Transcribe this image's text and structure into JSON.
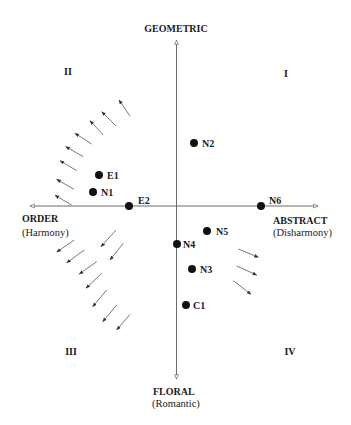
{
  "axes": {
    "vertical": {
      "x": 176.5,
      "y1": 40,
      "y2": 379
    },
    "horizontal": {
      "y": 206,
      "x1": 30,
      "x2": 318
    },
    "top": {
      "label": "GEOMETRIC"
    },
    "bottom": {
      "label": "FLORAL",
      "sublabel": "(Romantic)"
    },
    "left": {
      "label": "ORDER",
      "sublabel": "(Harmony)"
    },
    "right": {
      "label": "ABSTRACT",
      "sublabel": "(Disharmony)"
    }
  },
  "quadrants": {
    "q1": "I",
    "q2": "II",
    "q3": "III",
    "q4": "IV"
  },
  "points": [
    {
      "label": "E1",
      "x": 99,
      "y": 175,
      "lx": 107,
      "ly": 179
    },
    {
      "label": "N1",
      "x": 93,
      "y": 192,
      "lx": 101,
      "ly": 196
    },
    {
      "label": "E2",
      "x": 129,
      "y": 206,
      "lx": 138,
      "ly": 204
    },
    {
      "label": "N2",
      "x": 194,
      "y": 143,
      "lx": 202,
      "ly": 147
    },
    {
      "label": "N6",
      "x": 261,
      "y": 206,
      "lx": 269,
      "ly": 204
    },
    {
      "label": "N5",
      "x": 207,
      "y": 231,
      "lx": 216,
      "ly": 235
    },
    {
      "label": "N4",
      "x": 177,
      "y": 244,
      "lx": 183,
      "ly": 248
    },
    {
      "label": "N3",
      "x": 192,
      "y": 269,
      "lx": 200,
      "ly": 273
    },
    {
      "label": "C1",
      "x": 186,
      "y": 305,
      "lx": 193,
      "ly": 309
    }
  ],
  "arrows": [
    {
      "group": "upper-left",
      "x1": 130,
      "y1": 116,
      "x2": 119,
      "y2": 100
    },
    {
      "group": "upper-left",
      "x1": 116,
      "y1": 126,
      "x2": 101.7,
      "y2": 111.7
    },
    {
      "group": "upper-left",
      "x1": 103.3,
      "y1": 135,
      "x2": 90,
      "y2": 120.7
    },
    {
      "group": "upper-left",
      "x1": 91.7,
      "y1": 144,
      "x2": 75,
      "y2": 133.3
    },
    {
      "group": "upper-left",
      "x1": 83.3,
      "y1": 156.7,
      "x2": 65.7,
      "y2": 146.7
    },
    {
      "group": "upper-left",
      "x1": 76.7,
      "y1": 170.7,
      "x2": 60,
      "y2": 160.7
    },
    {
      "group": "upper-left",
      "x1": 74,
      "y1": 189.3,
      "x2": 56.7,
      "y2": 179.3
    },
    {
      "group": "upper-left",
      "x1": 71.7,
      "y1": 205,
      "x2": 55,
      "y2": 195.3
    },
    {
      "group": "lower-left",
      "x1": 74.3,
      "y1": 240,
      "x2": 56.7,
      "y2": 252
    },
    {
      "group": "lower-left",
      "x1": 116,
      "y1": 230,
      "x2": 101,
      "y2": 246.7
    },
    {
      "group": "lower-left",
      "x1": 84.3,
      "y1": 250,
      "x2": 66.7,
      "y2": 262.7
    },
    {
      "group": "lower-left",
      "x1": 123.3,
      "y1": 243.3,
      "x2": 110,
      "y2": 260
    },
    {
      "group": "lower-left",
      "x1": 96.7,
      "y1": 261.7,
      "x2": 79.3,
      "y2": 274
    },
    {
      "group": "lower-left",
      "x1": 101.7,
      "y1": 273.3,
      "x2": 86,
      "y2": 288.3
    },
    {
      "group": "lower-left",
      "x1": 106.7,
      "y1": 290,
      "x2": 92.7,
      "y2": 306.7
    },
    {
      "group": "lower-left",
      "x1": 116.7,
      "y1": 305,
      "x2": 102.7,
      "y2": 321.7
    },
    {
      "group": "lower-left",
      "x1": 130,
      "y1": 314.3,
      "x2": 116.7,
      "y2": 330
    },
    {
      "group": "lower-right",
      "x1": 238.3,
      "y1": 249,
      "x2": 258.3,
      "y2": 257.3
    },
    {
      "group": "lower-right",
      "x1": 236.7,
      "y1": 266,
      "x2": 256.7,
      "y2": 275
    },
    {
      "group": "lower-right",
      "x1": 233.3,
      "y1": 280.7,
      "x2": 251,
      "y2": 294.3
    }
  ],
  "colors": {
    "background": "#ffffff",
    "axis": "#5a5a5a",
    "arrow": "#6a6a6a",
    "point": "#111111",
    "text": "#1a1a1a"
  }
}
